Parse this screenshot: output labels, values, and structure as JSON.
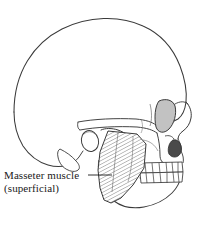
{
  "figure": {
    "view": "lateral",
    "background_color": "#ffffff",
    "outline_color": "#3a3a3a",
    "muscle_striation_color": "#6e6e6e",
    "shading_color": "#b9b9b9",
    "dark_shading_color": "#4a4a4a"
  },
  "labels": {
    "masseter": {
      "line1": "Masseter muscle",
      "line2": "(superficial)"
    }
  },
  "structures": {
    "cranium": "cranial-vault",
    "orbit": "eye-socket",
    "zygomatic_arch": "zygomatic-arch",
    "nasal_aperture": "nasal-aperture",
    "maxilla": "maxilla",
    "mandible": "mandible",
    "mastoid_process": "mastoid-process",
    "ear_canal": "external-auditory-meatus",
    "upper_teeth": "upper-dental-arch",
    "lower_teeth": "lower-dental-arch",
    "masseter_muscle": "masseter-muscle"
  },
  "teeth": {
    "upper_count": 7,
    "lower_count": 7
  }
}
